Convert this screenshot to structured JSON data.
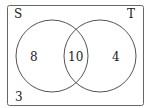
{
  "diagram": {
    "type": "venn",
    "universe_label": "S",
    "sets": [
      {
        "name": "S",
        "label": "S"
      },
      {
        "name": "T",
        "label": "T"
      }
    ],
    "regions": {
      "only_s": "8",
      "both": "10",
      "only_t": "4",
      "outside": "3"
    },
    "colors": {
      "stroke": "#555555",
      "text": "#222222",
      "background": "#ffffff"
    }
  }
}
